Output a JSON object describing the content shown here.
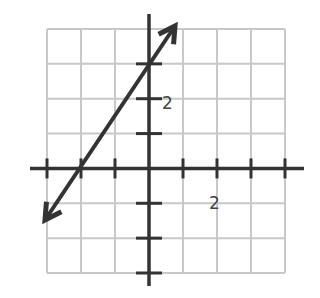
{
  "chart_data": {
    "type": "line",
    "title": "",
    "xlabel": "",
    "ylabel": "",
    "xlim": [
      -3,
      4
    ],
    "ylim": [
      -3,
      4
    ],
    "grid": true,
    "tick_labels": {
      "x": [
        "2"
      ],
      "y": [
        "2"
      ]
    },
    "series": [
      {
        "name": "line",
        "equation": "y = 1.5x + 3",
        "slope": 1.5,
        "y_intercept": 3,
        "x_intercept": -2,
        "x": [
          -3,
          -2,
          0,
          0.67
        ],
        "y": [
          -1.5,
          0,
          3,
          4
        ],
        "arrows": "both"
      }
    ],
    "colors": {
      "grid": "#c8c8c8",
      "axis": "#333333",
      "line": "#333333"
    }
  },
  "labels": {
    "x_tick": "2",
    "y_tick": "2"
  }
}
